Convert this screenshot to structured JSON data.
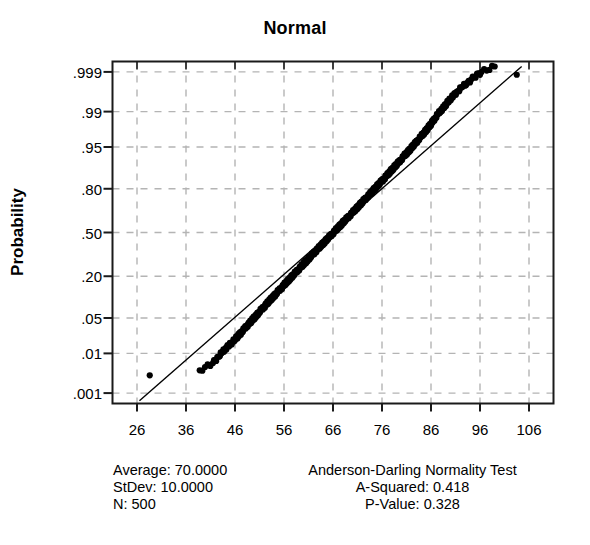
{
  "chart_data": {
    "type": "scatter",
    "title": "Normal",
    "subtitle": "",
    "xlabel": "",
    "ylabel": "Probability",
    "grid": true,
    "grid_style": "dashed",
    "legend": "none",
    "x_ticks": [
      26,
      36,
      46,
      56,
      66,
      76,
      86,
      96,
      106
    ],
    "x_tick_labels": [
      "26",
      "36",
      "46",
      "56",
      "66",
      "76",
      "86",
      "96",
      "106"
    ],
    "xlim": [
      21,
      111
    ],
    "y_ticks": [
      0.001,
      0.01,
      0.05,
      0.2,
      0.5,
      0.8,
      0.95,
      0.99,
      0.999
    ],
    "y_tick_labels": [
      ".001",
      ".01",
      ".05",
      ".20",
      ".50",
      ".80",
      ".95",
      ".99",
      ".999"
    ],
    "y_scale": "normal-probability",
    "ylim": [
      0.0005,
      0.9995
    ],
    "reference_line": {
      "description": "fitted normal reference line",
      "x_start": 26.5,
      "p_start": 0.0006,
      "x_end": 104.5,
      "p_end": 0.9993
    },
    "series": [
      {
        "name": "Sample percentiles",
        "marker": "filled-circle",
        "color": "#000000",
        "n": 500,
        "points": [
          [
            28.6,
            0.003
          ],
          [
            38.8,
            0.004
          ],
          [
            41.5,
            0.006
          ],
          [
            42.6,
            0.0085
          ],
          [
            43.4,
            0.0105
          ],
          [
            44.0,
            0.0125
          ],
          [
            44.6,
            0.0145
          ],
          [
            45.5,
            0.0175
          ],
          [
            46.4,
            0.022
          ],
          [
            46.9,
            0.025
          ],
          [
            47.4,
            0.028
          ],
          [
            47.9,
            0.032
          ],
          [
            48.4,
            0.036
          ],
          [
            48.9,
            0.04
          ],
          [
            49.4,
            0.045
          ],
          [
            49.9,
            0.05
          ],
          [
            50.4,
            0.056
          ],
          [
            50.9,
            0.062
          ],
          [
            51.4,
            0.069
          ],
          [
            51.9,
            0.076
          ],
          [
            52.4,
            0.084
          ],
          [
            52.9,
            0.092
          ],
          [
            53.4,
            0.101
          ],
          [
            53.9,
            0.11
          ],
          [
            54.4,
            0.12
          ],
          [
            54.9,
            0.131
          ],
          [
            55.4,
            0.142
          ],
          [
            55.9,
            0.154
          ],
          [
            56.4,
            0.166
          ],
          [
            56.9,
            0.179
          ],
          [
            57.4,
            0.193
          ],
          [
            57.9,
            0.207
          ],
          [
            58.4,
            0.222
          ],
          [
            58.9,
            0.237
          ],
          [
            59.4,
            0.253
          ],
          [
            59.9,
            0.269
          ],
          [
            60.4,
            0.286
          ],
          [
            60.9,
            0.303
          ],
          [
            61.4,
            0.321
          ],
          [
            61.9,
            0.339
          ],
          [
            62.4,
            0.357
          ],
          [
            62.9,
            0.376
          ],
          [
            63.4,
            0.395
          ],
          [
            63.9,
            0.414
          ],
          [
            64.4,
            0.433
          ],
          [
            64.9,
            0.453
          ],
          [
            65.4,
            0.472
          ],
          [
            65.9,
            0.492
          ],
          [
            66.4,
            0.512
          ],
          [
            66.9,
            0.532
          ],
          [
            67.4,
            0.551
          ],
          [
            67.9,
            0.571
          ],
          [
            68.4,
            0.59
          ],
          [
            68.9,
            0.609
          ],
          [
            69.4,
            0.628
          ],
          [
            69.9,
            0.647
          ],
          [
            70.4,
            0.665
          ],
          [
            70.9,
            0.683
          ],
          [
            71.4,
            0.701
          ],
          [
            71.9,
            0.718
          ],
          [
            72.4,
            0.735
          ],
          [
            72.9,
            0.751
          ],
          [
            73.4,
            0.767
          ],
          [
            73.9,
            0.782
          ],
          [
            74.4,
            0.797
          ],
          [
            74.9,
            0.811
          ],
          [
            75.4,
            0.825
          ],
          [
            75.9,
            0.838
          ],
          [
            76.4,
            0.85
          ],
          [
            76.9,
            0.862
          ],
          [
            77.4,
            0.873
          ],
          [
            77.9,
            0.884
          ],
          [
            78.4,
            0.894
          ],
          [
            78.9,
            0.903
          ],
          [
            79.4,
            0.912
          ],
          [
            79.9,
            0.92
          ],
          [
            80.4,
            0.928
          ],
          [
            80.9,
            0.935
          ],
          [
            81.4,
            0.941
          ],
          [
            81.9,
            0.947
          ],
          [
            82.4,
            0.953
          ],
          [
            82.9,
            0.958
          ],
          [
            83.4,
            0.963
          ],
          [
            83.9,
            0.967
          ],
          [
            84.4,
            0.971
          ],
          [
            84.9,
            0.9745
          ],
          [
            85.4,
            0.978
          ],
          [
            85.9,
            0.981
          ],
          [
            86.4,
            0.984
          ],
          [
            86.9,
            0.9865
          ],
          [
            87.4,
            0.9885
          ],
          [
            88.0,
            0.9905
          ],
          [
            88.6,
            0.992
          ],
          [
            89.2,
            0.9935
          ],
          [
            89.9,
            0.9948
          ],
          [
            90.6,
            0.9958
          ],
          [
            91.4,
            0.9967
          ],
          [
            92.3,
            0.9974
          ],
          [
            93.4,
            0.998
          ],
          [
            94.8,
            0.9986
          ],
          [
            96.3,
            0.999
          ],
          [
            99.0,
            0.9993
          ],
          [
            103.5,
            0.9988
          ]
        ]
      }
    ],
    "annotations": {
      "statistics": {
        "average_label": "Average: 70.0000",
        "stdev_label": "StDev: 10.0000",
        "n_label": "N: 500"
      },
      "normality_test": {
        "test_name": "Anderson-Darling Normality Test",
        "a_squared_label": "A-Squared: 0.418",
        "p_value_label": "P-Value: 0.328"
      }
    }
  },
  "colors": {
    "marker": "#000000",
    "reference_line": "#000000",
    "grid": "#b4b4b4",
    "frame": "#1a1a1a",
    "background": "#ffffff"
  }
}
